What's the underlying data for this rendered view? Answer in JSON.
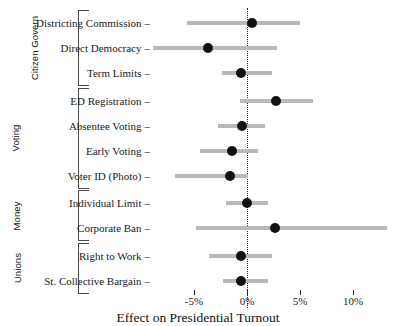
{
  "chart_data": {
    "type": "scatter",
    "title": "",
    "xlabel": "Effect on Presidential Turnout",
    "ylabel": "",
    "xlim": [
      -6.8,
      11.4
    ],
    "xticks": [
      -5,
      0,
      5,
      10
    ],
    "xticklabels": [
      "-5%",
      "0%",
      "5%",
      "10%"
    ],
    "grid": false,
    "legend": null,
    "zero_reference_line": 0,
    "units": "percentage points",
    "orientation": "horizontal",
    "estimate_marker": "filled-circle",
    "interval_marker": "horizontal-bar",
    "groups": [
      {
        "name": "Citizen Govern",
        "rows": [
          {
            "label": "Districting Commission",
            "estimate": 0.5,
            "low": -5.7,
            "high": 5.0
          },
          {
            "label": "Direct Democracy",
            "estimate": -3.7,
            "low": -8.9,
            "high": 2.8
          },
          {
            "label": "Term Limits",
            "estimate": -0.6,
            "low": -2.4,
            "high": 2.4
          }
        ]
      },
      {
        "name": "Voting",
        "rows": [
          {
            "label": "ED Registration",
            "estimate": 2.7,
            "low": -0.7,
            "high": 6.2
          },
          {
            "label": "Absentee Voting",
            "estimate": -0.5,
            "low": -2.7,
            "high": 1.7
          },
          {
            "label": "Early Voting",
            "estimate": -1.4,
            "low": -4.4,
            "high": 1.0
          },
          {
            "label": "Voter ID (Photo)",
            "estimate": -1.6,
            "low": -6.8,
            "high": 0.1
          }
        ]
      },
      {
        "name": "Money",
        "rows": [
          {
            "label": "Individual Limit",
            "estimate": 0.0,
            "low": -2.0,
            "high": 2.0
          },
          {
            "label": "Corporate Ban",
            "estimate": 2.6,
            "low": -4.8,
            "high": 13.2
          }
        ]
      },
      {
        "name": "Unions",
        "rows": [
          {
            "label": "Right to Work",
            "estimate": -0.6,
            "low": -3.6,
            "high": 2.4
          },
          {
            "label": "St. Collective Bargain",
            "estimate": -0.6,
            "low": -2.3,
            "high": 2.0
          }
        ]
      }
    ]
  },
  "style": {
    "point_color": "#111111",
    "interval_color": "#b9b9b9",
    "zero_line_color": "#222222",
    "background": "#ffffff"
  },
  "axis": {
    "tick_dash": "–"
  }
}
